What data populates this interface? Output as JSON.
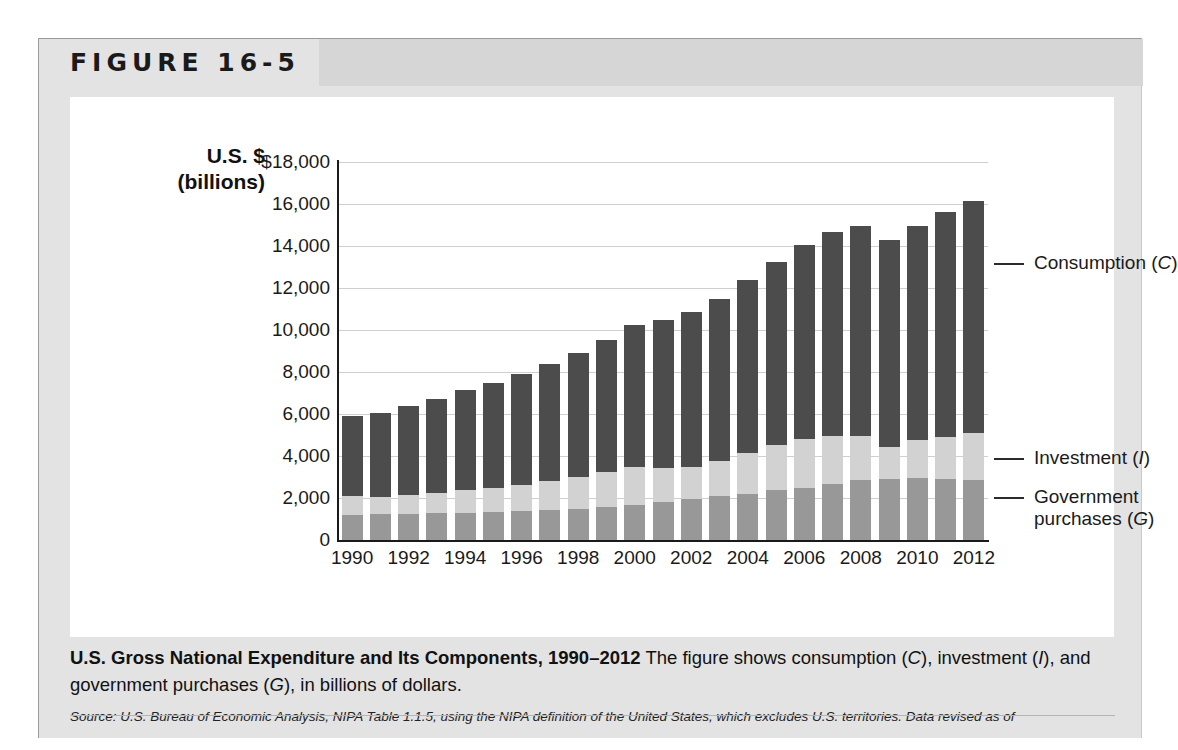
{
  "figure": {
    "label": "FIGURE 16-5"
  },
  "axis_title": "U.S. $\n(billions)",
  "axis_title_line1": "U.S. $",
  "axis_title_line2": "(billions)",
  "callouts": {
    "consumption": "Consumption (C)",
    "investment": "Investment (I)",
    "government_line1": "Government",
    "government_line2": "purchases (G)"
  },
  "caption": {
    "title": "U.S. Gross National Expenditure and Its Components, 1990–2012",
    "body_pre": "The figure shows consumption (",
    "body_c": "C",
    "body_mid1": "), investment (",
    "body_i": "I",
    "body_mid2": "), and government purchases (",
    "body_g": "G",
    "body_post": "), in billions of dollars.",
    "source": "Source: U.S. Bureau of Economic Analysis, NIPA Table 1.1.5, using the NIPA definition of the United States, which excludes U.S. territories. Data revised as of"
  },
  "colors": {
    "consumption": "#4c4c4c",
    "investment": "#d2d2d2",
    "government": "#989898",
    "panel": "#e3e3e3",
    "header_band": "#d6d6d6",
    "gridline": "#cfcfcf",
    "axis": "#1a1a1a"
  },
  "chart_data": {
    "type": "bar",
    "subtype": "stacked-column",
    "title": "U.S. Gross National Expenditure and Its Components, 1990–2012",
    "xlabel": "",
    "ylabel": "U.S. $ (billions)",
    "ylim": [
      0,
      18000
    ],
    "ytick_values": [
      0,
      2000,
      4000,
      6000,
      8000,
      10000,
      12000,
      14000,
      16000,
      18000
    ],
    "ytick_labels": [
      "0",
      "2,000",
      "4,000",
      "6,000",
      "8,000",
      "10,000",
      "12,000",
      "14,000",
      "16,000",
      "$18,000"
    ],
    "grid": true,
    "legend_position": "right-callouts",
    "categories": [
      1990,
      1991,
      1992,
      1993,
      1994,
      1995,
      1996,
      1997,
      1998,
      1999,
      2000,
      2001,
      2002,
      2003,
      2004,
      2005,
      2006,
      2007,
      2008,
      2009,
      2010,
      2011,
      2012
    ],
    "xtick_labels": [
      "1990",
      "1992",
      "1994",
      "1996",
      "1998",
      "2000",
      "2002",
      "2004",
      "2006",
      "2008",
      "2010",
      "2012"
    ],
    "series": [
      {
        "name": "Government purchases (G)",
        "symbol": "G",
        "color": "#989898",
        "values": [
          1180,
          1230,
          1250,
          1270,
          1290,
          1330,
          1370,
          1420,
          1480,
          1570,
          1680,
          1800,
          1950,
          2080,
          2210,
          2360,
          2500,
          2650,
          2850,
          2900,
          2950,
          2900,
          2850
        ]
      },
      {
        "name": "Investment (I)",
        "symbol": "I",
        "color": "#d2d2d2",
        "values": [
          900,
          830,
          900,
          980,
          1100,
          1150,
          1250,
          1390,
          1520,
          1650,
          1790,
          1630,
          1550,
          1680,
          1940,
          2170,
          2330,
          2290,
          2090,
          1550,
          1810,
          2010,
          2240
        ]
      },
      {
        "name": "Consumption (C)",
        "symbol": "C",
        "color": "#4c4c4c",
        "values": [
          3830,
          4010,
          4230,
          4480,
          4740,
          4980,
          5270,
          5570,
          5910,
          6320,
          6790,
          7070,
          7370,
          7730,
          8210,
          8690,
          9200,
          9750,
          10010,
          9840,
          10200,
          10690,
          11050
        ]
      }
    ],
    "totals": [
      5910,
      6070,
      6380,
      6730,
      7130,
      7460,
      7890,
      8380,
      8910,
      9540,
      10260,
      10500,
      10870,
      11490,
      12360,
      13220,
      14030,
      14690,
      14950,
      14290,
      14960,
      15600,
      16140
    ]
  }
}
